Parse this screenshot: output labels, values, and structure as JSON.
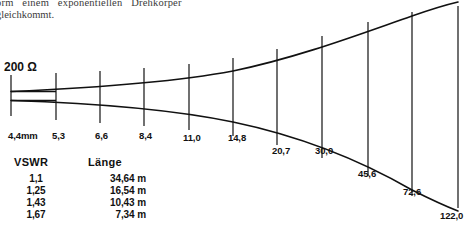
{
  "document": {
    "caption_line1": "orm  einem  exponentiellen  Drehkörper",
    "caption_line2": "gleichkommt."
  },
  "diagram": {
    "impedance_label": "200 Ω",
    "type": "exponential-horn-profile",
    "axis_labels": [
      {
        "text": "4,4mm",
        "x": 8,
        "y": 130
      },
      {
        "text": "5,3",
        "x": 52,
        "y": 130
      },
      {
        "text": "6,6",
        "x": 95,
        "y": 130
      },
      {
        "text": "8,4",
        "x": 139,
        "y": 130
      },
      {
        "text": "11,0",
        "x": 183,
        "y": 132
      },
      {
        "text": "14,8",
        "x": 228,
        "y": 132
      },
      {
        "text": "20,7",
        "x": 272,
        "y": 145
      },
      {
        "text": "30,0",
        "x": 315,
        "y": 145
      },
      {
        "text": "45,6",
        "x": 358,
        "y": 168
      },
      {
        "text": "72,6",
        "x": 403,
        "y": 186
      },
      {
        "text": "122,0",
        "x": 440,
        "y": 210
      }
    ],
    "ticks": [
      {
        "x": 11,
        "y1": 75,
        "y2": 116
      },
      {
        "x": 56,
        "y1": 73,
        "y2": 120
      },
      {
        "x": 100,
        "y1": 71,
        "y2": 123
      },
      {
        "x": 144,
        "y1": 68,
        "y2": 126
      },
      {
        "x": 189,
        "y1": 64,
        "y2": 130
      },
      {
        "x": 233,
        "y1": 58,
        "y2": 136
      },
      {
        "x": 277,
        "y1": 49,
        "y2": 145
      },
      {
        "x": 322,
        "y1": 36,
        "y2": 158
      },
      {
        "x": 368,
        "y1": 22,
        "y2": 176
      },
      {
        "x": 412,
        "y1": 12,
        "y2": 196
      },
      {
        "x": 458,
        "y1": 6,
        "y2": 208
      }
    ],
    "upper_curve": "M 11,91.5 C 90,88 170,83 233,71 C 300,57 360,34 412,16 C 432,9 445,5 458,2",
    "lower_curve": "M 11,100.5 C 90,103 170,109 233,122 C 300,136 360,160 412,190 C 432,200 445,206 458,211",
    "throat_line_top_y": 91.5,
    "throat_line_bottom_y": 100.5,
    "stroke_color": "#111111"
  },
  "table": {
    "headers": [
      "VSWR",
      "Länge"
    ],
    "rows": [
      {
        "vswr": "1,1",
        "laenge": "34,64 m"
      },
      {
        "vswr": "1,25",
        "laenge": "16,54 m"
      },
      {
        "vswr": "1,43",
        "laenge": "10,43 m"
      },
      {
        "vswr": "1,67",
        "laenge": "7,34 m"
      }
    ]
  }
}
